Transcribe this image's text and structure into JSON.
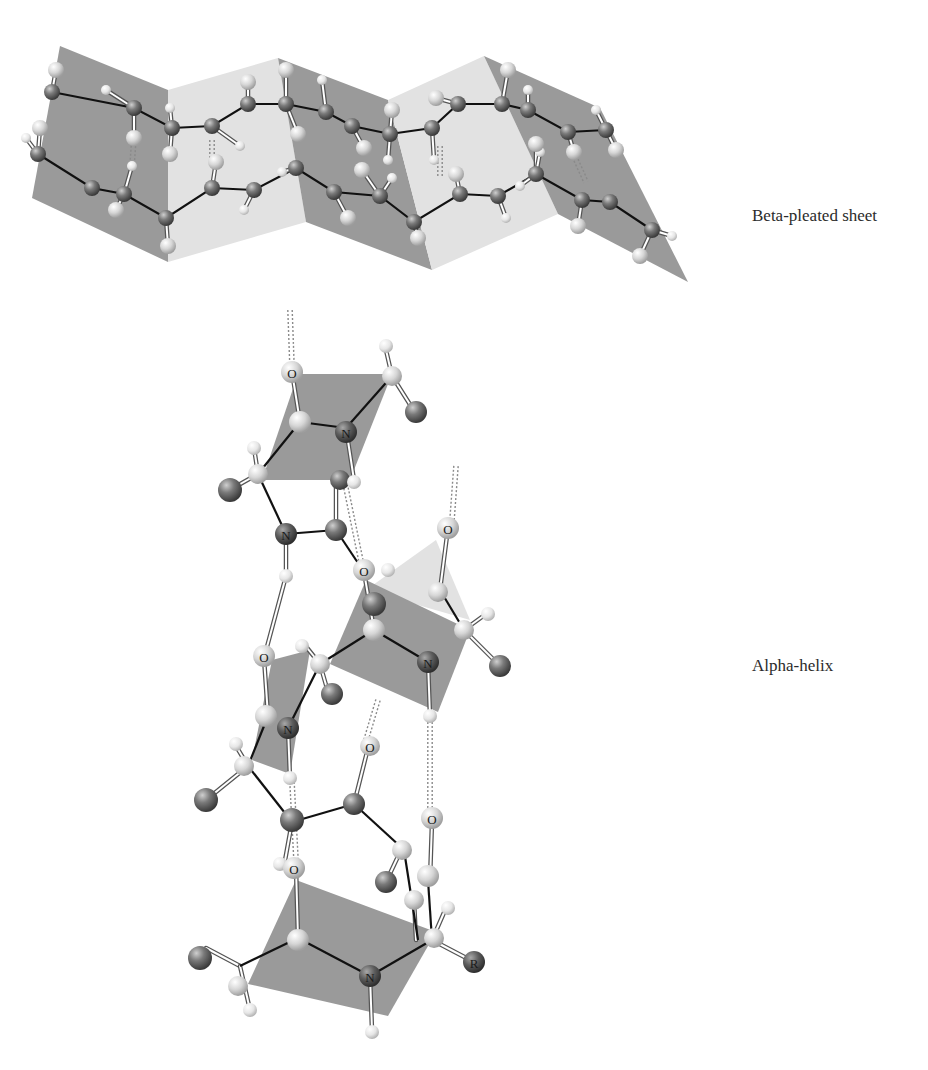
{
  "figure": {
    "type": "protein secondary structure illustration",
    "panels": [
      {
        "id": "beta",
        "label": "Beta-pleated sheet"
      },
      {
        "id": "alpha",
        "label": "Alpha-helix"
      }
    ]
  },
  "colors": {
    "plane_dark": "#9a9a9a",
    "plane_light": "#e2e2e2",
    "carbon_atom": "#6e6e6e",
    "light_atom": "#d8d8d8",
    "hydrogen_atom": "#ececec",
    "nitrogen_atom": "#555555",
    "bond": "#111111",
    "label_text": "#2b2b2b"
  },
  "beta": {
    "planes": [
      {
        "pts": "60,46 168,90 168,262 32,198",
        "shade": "dark"
      },
      {
        "pts": "168,90 278,58 306,222 168,262",
        "shade": "light"
      },
      {
        "pts": "278,58 388,100 432,270 306,222",
        "shade": "dark"
      },
      {
        "pts": "388,100 484,56 558,214 432,270",
        "shade": "light"
      },
      {
        "pts": "484,56 600,108 688,282 558,214",
        "shade": "dark"
      }
    ],
    "chains": [
      [
        [
          52,
          92
        ],
        [
          134,
          108
        ],
        [
          172,
          128
        ],
        [
          212,
          126
        ],
        [
          248,
          104
        ],
        [
          286,
          104
        ],
        [
          326,
          112
        ],
        [
          352,
          126
        ],
        [
          390,
          134
        ],
        [
          432,
          128
        ],
        [
          458,
          104
        ],
        [
          502,
          104
        ],
        [
          528,
          110
        ],
        [
          568,
          132
        ],
        [
          606,
          130
        ]
      ],
      [
        [
          38,
          154
        ],
        [
          92,
          188
        ],
        [
          124,
          194
        ],
        [
          166,
          218
        ],
        [
          212,
          188
        ],
        [
          254,
          190
        ],
        [
          296,
          168
        ],
        [
          334,
          192
        ],
        [
          380,
          196
        ],
        [
          414,
          222
        ],
        [
          460,
          194
        ],
        [
          498,
          196
        ],
        [
          536,
          174
        ],
        [
          582,
          200
        ],
        [
          610,
          202
        ],
        [
          652,
          230
        ]
      ]
    ],
    "carbons": [
      [
        52,
        92
      ],
      [
        134,
        108
      ],
      [
        172,
        128
      ],
      [
        212,
        126
      ],
      [
        248,
        104
      ],
      [
        286,
        104
      ],
      [
        326,
        112
      ],
      [
        352,
        126
      ],
      [
        390,
        134
      ],
      [
        432,
        128
      ],
      [
        458,
        104
      ],
      [
        502,
        104
      ],
      [
        528,
        110
      ],
      [
        568,
        132
      ],
      [
        606,
        130
      ],
      [
        38,
        154
      ],
      [
        92,
        188
      ],
      [
        124,
        194
      ],
      [
        166,
        218
      ],
      [
        212,
        188
      ],
      [
        254,
        190
      ],
      [
        296,
        168
      ],
      [
        334,
        192
      ],
      [
        380,
        196
      ],
      [
        414,
        222
      ],
      [
        460,
        194
      ],
      [
        498,
        196
      ],
      [
        536,
        174
      ],
      [
        582,
        200
      ],
      [
        610,
        202
      ],
      [
        652,
        230
      ]
    ],
    "light": [
      [
        56,
        70
      ],
      [
        40,
        128
      ],
      [
        134,
        138
      ],
      [
        170,
        154
      ],
      [
        248,
        82
      ],
      [
        286,
        70
      ],
      [
        298,
        134
      ],
      [
        364,
        148
      ],
      [
        392,
        110
      ],
      [
        436,
        98
      ],
      [
        508,
        70
      ],
      [
        536,
        144
      ],
      [
        574,
        152
      ],
      [
        616,
        150
      ],
      [
        116,
        210
      ],
      [
        168,
        246
      ],
      [
        216,
        162
      ],
      [
        348,
        218
      ],
      [
        362,
        170
      ],
      [
        418,
        238
      ],
      [
        456,
        174
      ],
      [
        578,
        226
      ],
      [
        640,
        256
      ]
    ],
    "hydrogens": [
      [
        106,
        90
      ],
      [
        26,
        138
      ],
      [
        132,
        166
      ],
      [
        170,
        108
      ],
      [
        240,
        146
      ],
      [
        244,
        210
      ],
      [
        282,
        172
      ],
      [
        322,
        80
      ],
      [
        388,
        160
      ],
      [
        392,
        178
      ],
      [
        434,
        160
      ],
      [
        506,
        218
      ],
      [
        540,
        152
      ],
      [
        528,
        90
      ],
      [
        596,
        110
      ],
      [
        672,
        236
      ],
      [
        520,
        186
      ]
    ],
    "hbonds": [
      [
        [
          134,
          138
        ],
        [
          132,
          166
        ]
      ],
      [
        [
          212,
          140
        ],
        [
          212,
          166
        ]
      ],
      [
        [
          440,
          146
        ],
        [
          440,
          176
        ]
      ],
      [
        [
          576,
          160
        ],
        [
          586,
          182
        ]
      ]
    ]
  },
  "alpha": {
    "planes": [
      {
        "pts": "298,374 392,374 350,480 262,480",
        "shade": "dark"
      },
      {
        "pts": "436,540 470,620 366,590",
        "shade": "light"
      },
      {
        "pts": "366,580 470,630 438,712 330,664",
        "shade": "dark"
      },
      {
        "pts": "272,660 310,650 290,774 252,760",
        "shade": "dark"
      },
      {
        "pts": "296,880 436,932 388,1016 248,984",
        "shade": "dark"
      }
    ],
    "bonds": [
      [
        [
          300,
          422
        ],
        [
          346,
          428
        ]
      ],
      [
        [
          346,
          428
        ],
        [
          392,
          376
        ]
      ],
      [
        [
          258,
          474
        ],
        [
          300,
          422
        ]
      ],
      [
        [
          258,
          474
        ],
        [
          286,
          534
        ]
      ],
      [
        [
          286,
          534
        ],
        [
          336,
          530
        ]
      ],
      [
        [
          336,
          530
        ],
        [
          364,
          572
        ]
      ],
      [
        [
          440,
          590
        ],
        [
          464,
          630
        ]
      ],
      [
        [
          374,
          630
        ],
        [
          428,
          662
        ]
      ],
      [
        [
          320,
          664
        ],
        [
          374,
          630
        ]
      ],
      [
        [
          320,
          664
        ],
        [
          288,
          728
        ]
      ],
      [
        [
          248,
          766
        ],
        [
          268,
          716
        ]
      ],
      [
        [
          248,
          766
        ],
        [
          292,
          822
        ]
      ],
      [
        [
          292,
          822
        ],
        [
          354,
          804
        ]
      ],
      [
        [
          354,
          804
        ],
        [
          402,
          848
        ]
      ],
      [
        [
          240,
          966
        ],
        [
          298,
          938
        ]
      ],
      [
        [
          298,
          938
        ],
        [
          370,
          976
        ]
      ],
      [
        [
          370,
          976
        ],
        [
          432,
          940
        ]
      ],
      [
        [
          404,
          850
        ],
        [
          418,
          940
        ]
      ],
      [
        [
          432,
          940
        ],
        [
          428,
          880
        ]
      ]
    ],
    "whitebonds": [
      [
        [
          292,
          372
        ],
        [
          300,
          422
        ]
      ],
      [
        [
          346,
          428
        ],
        [
          354,
          480
        ]
      ],
      [
        [
          336,
          480
        ],
        [
          336,
          530
        ]
      ],
      [
        [
          392,
          376
        ],
        [
          416,
          414
        ]
      ],
      [
        [
          386,
          350
        ],
        [
          392,
          376
        ]
      ],
      [
        [
          258,
          474
        ],
        [
          226,
          492
        ]
      ],
      [
        [
          254,
          448
        ],
        [
          258,
          474
        ]
      ],
      [
        [
          286,
          534
        ],
        [
          286,
          576
        ]
      ],
      [
        [
          286,
          576
        ],
        [
          264,
          658
        ]
      ],
      [
        [
          364,
          572
        ],
        [
          374,
          630
        ]
      ],
      [
        [
          448,
          528
        ],
        [
          440,
          590
        ]
      ],
      [
        [
          464,
          630
        ],
        [
          500,
          666
        ]
      ],
      [
        [
          464,
          630
        ],
        [
          486,
          614
        ]
      ],
      [
        [
          428,
          662
        ],
        [
          430,
          716
        ]
      ],
      [
        [
          264,
          658
        ],
        [
          268,
          716
        ]
      ],
      [
        [
          320,
          664
        ],
        [
          328,
          692
        ]
      ],
      [
        [
          320,
          664
        ],
        [
          304,
          644
        ]
      ],
      [
        [
          248,
          766
        ],
        [
          206,
          800
        ]
      ],
      [
        [
          248,
          766
        ],
        [
          236,
          746
        ]
      ],
      [
        [
          288,
          728
        ],
        [
          290,
          778
        ]
      ],
      [
        [
          368,
          748
        ],
        [
          354,
          804
        ]
      ],
      [
        [
          292,
          822
        ],
        [
          284,
          866
        ]
      ],
      [
        [
          402,
          848
        ],
        [
          386,
          882
        ]
      ],
      [
        [
          296,
          868
        ],
        [
          298,
          938
        ]
      ],
      [
        [
          240,
          966
        ],
        [
          206,
          948
        ]
      ],
      [
        [
          240,
          966
        ],
        [
          250,
          1010
        ]
      ],
      [
        [
          370,
          976
        ],
        [
          372,
          1030
        ]
      ],
      [
        [
          432,
          940
        ],
        [
          474,
          962
        ]
      ],
      [
        [
          432,
          940
        ],
        [
          446,
          908
        ]
      ],
      [
        [
          432,
          822
        ],
        [
          430,
          880
        ]
      ],
      [
        [
          414,
          900
        ],
        [
          416,
          940
        ]
      ]
    ],
    "hbonds": [
      [
        [
          290,
          310
        ],
        [
          292,
          366
        ]
      ],
      [
        [
          456,
          466
        ],
        [
          452,
          520
        ]
      ],
      [
        [
          346,
          488
        ],
        [
          362,
          566
        ]
      ],
      [
        [
          378,
          700
        ],
        [
          366,
          740
        ]
      ],
      [
        [
          430,
          718
        ],
        [
          430,
          816
        ]
      ],
      [
        [
          292,
          782
        ],
        [
          296,
          860
        ]
      ]
    ],
    "atoms": [
      {
        "x": 292,
        "y": 372,
        "r": 11,
        "kind": "light",
        "letter": "O"
      },
      {
        "x": 392,
        "y": 376,
        "r": 10,
        "kind": "light"
      },
      {
        "x": 386,
        "y": 346,
        "r": 7,
        "kind": "hyd"
      },
      {
        "x": 416,
        "y": 412,
        "r": 11,
        "kind": "dark"
      },
      {
        "x": 300,
        "y": 422,
        "r": 11,
        "kind": "light"
      },
      {
        "x": 346,
        "y": 432,
        "r": 11,
        "kind": "nit",
        "letter": "N"
      },
      {
        "x": 254,
        "y": 448,
        "r": 7,
        "kind": "hyd"
      },
      {
        "x": 258,
        "y": 474,
        "r": 10,
        "kind": "light"
      },
      {
        "x": 230,
        "y": 490,
        "r": 12,
        "kind": "dark"
      },
      {
        "x": 340,
        "y": 480,
        "r": 10,
        "kind": "dark"
      },
      {
        "x": 354,
        "y": 482,
        "r": 7,
        "kind": "hyd"
      },
      {
        "x": 286,
        "y": 534,
        "r": 11,
        "kind": "nit",
        "letter": "N"
      },
      {
        "x": 336,
        "y": 530,
        "r": 11,
        "kind": "dark"
      },
      {
        "x": 286,
        "y": 576,
        "r": 7,
        "kind": "hyd"
      },
      {
        "x": 364,
        "y": 570,
        "r": 11,
        "kind": "light",
        "letter": "O"
      },
      {
        "x": 448,
        "y": 528,
        "r": 11,
        "kind": "light",
        "letter": "O"
      },
      {
        "x": 388,
        "y": 570,
        "r": 7,
        "kind": "hyd"
      },
      {
        "x": 374,
        "y": 604,
        "r": 12,
        "kind": "dark"
      },
      {
        "x": 438,
        "y": 592,
        "r": 10,
        "kind": "light"
      },
      {
        "x": 374,
        "y": 630,
        "r": 11,
        "kind": "light"
      },
      {
        "x": 464,
        "y": 630,
        "r": 10,
        "kind": "light"
      },
      {
        "x": 488,
        "y": 614,
        "r": 7,
        "kind": "hyd"
      },
      {
        "x": 500,
        "y": 666,
        "r": 11,
        "kind": "dark"
      },
      {
        "x": 428,
        "y": 662,
        "r": 11,
        "kind": "nit",
        "letter": "N"
      },
      {
        "x": 430,
        "y": 716,
        "r": 7,
        "kind": "hyd"
      },
      {
        "x": 264,
        "y": 656,
        "r": 11,
        "kind": "light",
        "letter": "O"
      },
      {
        "x": 320,
        "y": 664,
        "r": 10,
        "kind": "light"
      },
      {
        "x": 302,
        "y": 646,
        "r": 7,
        "kind": "hyd"
      },
      {
        "x": 332,
        "y": 694,
        "r": 11,
        "kind": "dark"
      },
      {
        "x": 266,
        "y": 716,
        "r": 11,
        "kind": "light"
      },
      {
        "x": 288,
        "y": 728,
        "r": 11,
        "kind": "nit",
        "letter": "N"
      },
      {
        "x": 236,
        "y": 744,
        "r": 7,
        "kind": "hyd"
      },
      {
        "x": 244,
        "y": 766,
        "r": 10,
        "kind": "light"
      },
      {
        "x": 290,
        "y": 778,
        "r": 7,
        "kind": "hyd"
      },
      {
        "x": 206,
        "y": 800,
        "r": 12,
        "kind": "dark"
      },
      {
        "x": 370,
        "y": 746,
        "r": 10,
        "kind": "light",
        "letter": "O"
      },
      {
        "x": 292,
        "y": 820,
        "r": 12,
        "kind": "dark"
      },
      {
        "x": 354,
        "y": 804,
        "r": 11,
        "kind": "dark"
      },
      {
        "x": 432,
        "y": 818,
        "r": 11,
        "kind": "light",
        "letter": "O"
      },
      {
        "x": 402,
        "y": 850,
        "r": 10,
        "kind": "light"
      },
      {
        "x": 386,
        "y": 882,
        "r": 11,
        "kind": "dark"
      },
      {
        "x": 428,
        "y": 876,
        "r": 11,
        "kind": "light"
      },
      {
        "x": 414,
        "y": 900,
        "r": 10,
        "kind": "light"
      },
      {
        "x": 280,
        "y": 864,
        "r": 7,
        "kind": "hyd"
      },
      {
        "x": 294,
        "y": 868,
        "r": 11,
        "kind": "light",
        "letter": "O"
      },
      {
        "x": 448,
        "y": 908,
        "r": 7,
        "kind": "hyd"
      },
      {
        "x": 434,
        "y": 938,
        "r": 10,
        "kind": "light"
      },
      {
        "x": 298,
        "y": 940,
        "r": 11,
        "kind": "light"
      },
      {
        "x": 474,
        "y": 962,
        "r": 11,
        "kind": "nit",
        "letter": "R"
      },
      {
        "x": 200,
        "y": 958,
        "r": 12,
        "kind": "dark"
      },
      {
        "x": 238,
        "y": 986,
        "r": 10,
        "kind": "light"
      },
      {
        "x": 250,
        "y": 1010,
        "r": 7,
        "kind": "hyd"
      },
      {
        "x": 370,
        "y": 976,
        "r": 11,
        "kind": "nit",
        "letter": "N"
      },
      {
        "x": 372,
        "y": 1032,
        "r": 7,
        "kind": "hyd"
      }
    ]
  }
}
